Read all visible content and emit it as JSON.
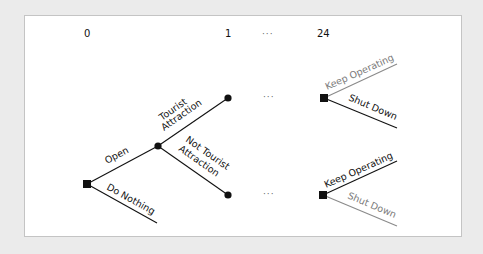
{
  "diagram": {
    "type": "decision-tree",
    "stages": [
      {
        "label": "0"
      },
      {
        "label": "1"
      },
      {
        "label": "···"
      },
      {
        "label": "24"
      }
    ],
    "ellipsis": "···",
    "root": {
      "type": "decision-node"
    },
    "branches": {
      "open": "Open",
      "do_nothing": "Do Nothing",
      "tourist": "Tourist Attraction",
      "tourist_line1": "Tourist",
      "tourist_line2": "Attraction",
      "not_tourist": "Not Tourist Attraction",
      "not_tourist_line1": "Not Tourist",
      "not_tourist_line2": "Attraction",
      "upper_keep": "Keep Operating",
      "upper_shut": "Shut Down",
      "lower_keep": "Keep Operating",
      "lower_shut": "Shut Down"
    },
    "colors": {
      "chosen": "#111111",
      "not_chosen": "#8a8a8a",
      "background": "#ebebeb",
      "panel": "#ffffff"
    }
  }
}
